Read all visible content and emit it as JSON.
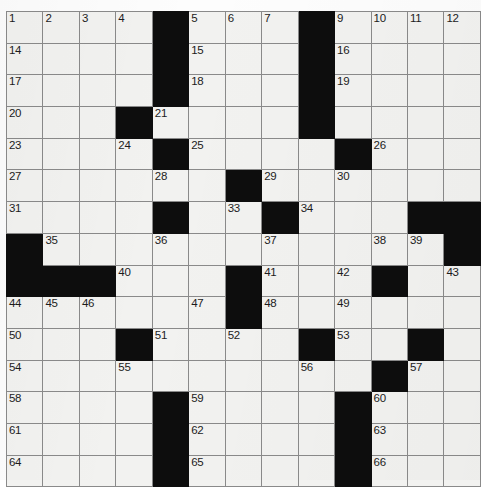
{
  "puzzle": {
    "title": "Crossword Grid",
    "type": "crossword",
    "columns": 13,
    "rows": 15,
    "colors": {
      "block": "#0d0d0d",
      "open_cell": "#f2f2f0",
      "grid_line": "#8a8a8a",
      "border": "#6b6b6b",
      "number_text": "#1c1c1c",
      "page_background": "#ffffff"
    },
    "cell_size_px": 32,
    "highest_clue_number": 66,
    "blocks": [
      [
        1,
        5
      ],
      [
        1,
        9
      ],
      [
        2,
        5
      ],
      [
        2,
        9
      ],
      [
        3,
        5
      ],
      [
        3,
        9
      ],
      [
        4,
        4
      ],
      [
        4,
        9
      ],
      [
        5,
        5
      ],
      [
        5,
        10
      ],
      [
        6,
        7
      ],
      [
        7,
        5
      ],
      [
        7,
        8
      ],
      [
        7,
        12
      ],
      [
        7,
        13
      ],
      [
        8,
        1
      ],
      [
        8,
        13
      ],
      [
        9,
        1
      ],
      [
        9,
        2
      ],
      [
        9,
        3
      ],
      [
        9,
        7
      ],
      [
        9,
        11
      ],
      [
        10,
        7
      ],
      [
        11,
        4
      ],
      [
        11,
        9
      ],
      [
        11,
        12
      ],
      [
        12,
        11
      ],
      [
        13,
        5
      ],
      [
        13,
        10
      ],
      [
        14,
        5
      ],
      [
        14,
        10
      ],
      [
        15,
        5
      ],
      [
        15,
        10
      ]
    ],
    "numbers": [
      {
        "n": 1,
        "row": 1,
        "col": 1
      },
      {
        "n": 2,
        "row": 1,
        "col": 2
      },
      {
        "n": 3,
        "row": 1,
        "col": 3
      },
      {
        "n": 4,
        "row": 1,
        "col": 4
      },
      {
        "n": 5,
        "row": 1,
        "col": 6
      },
      {
        "n": 6,
        "row": 1,
        "col": 7
      },
      {
        "n": 7,
        "row": 1,
        "col": 8
      },
      {
        "n": 8,
        "row": 1,
        "col": 9
      },
      {
        "n": 9,
        "row": 1,
        "col": 10
      },
      {
        "n": 10,
        "row": 1,
        "col": 11
      },
      {
        "n": 11,
        "row": 1,
        "col": 12
      },
      {
        "n": 12,
        "row": 1,
        "col": 13
      },
      {
        "n": 13,
        "row": 1,
        "col": 14
      },
      {
        "n": 14,
        "row": 2,
        "col": 1
      },
      {
        "n": 15,
        "row": 2,
        "col": 6
      },
      {
        "n": 16,
        "row": 2,
        "col": 10
      },
      {
        "n": 17,
        "row": 3,
        "col": 1
      },
      {
        "n": 18,
        "row": 3,
        "col": 6
      },
      {
        "n": 19,
        "row": 3,
        "col": 10
      },
      {
        "n": 20,
        "row": 4,
        "col": 1
      },
      {
        "n": 21,
        "row": 4,
        "col": 5
      },
      {
        "n": 22,
        "row": 4,
        "col": 9
      },
      {
        "n": 23,
        "row": 5,
        "col": 1
      },
      {
        "n": 24,
        "row": 5,
        "col": 4
      },
      {
        "n": 25,
        "row": 5,
        "col": 6
      },
      {
        "n": 26,
        "row": 5,
        "col": 11
      },
      {
        "n": 27,
        "row": 6,
        "col": 1
      },
      {
        "n": 28,
        "row": 6,
        "col": 5
      },
      {
        "n": 29,
        "row": 6,
        "col": 8
      },
      {
        "n": 30,
        "row": 6,
        "col": 10
      },
      {
        "n": 31,
        "row": 7,
        "col": 1
      },
      {
        "n": 32,
        "row": 7,
        "col": 5
      },
      {
        "n": 33,
        "row": 7,
        "col": 7
      },
      {
        "n": 34,
        "row": 7,
        "col": 9
      },
      {
        "n": 35,
        "row": 8,
        "col": 2
      },
      {
        "n": 36,
        "row": 8,
        "col": 5
      },
      {
        "n": 37,
        "row": 8,
        "col": 8
      },
      {
        "n": 38,
        "row": 8,
        "col": 11
      },
      {
        "n": 39,
        "row": 8,
        "col": 12
      },
      {
        "n": 40,
        "row": 9,
        "col": 4
      },
      {
        "n": 41,
        "row": 9,
        "col": 8
      },
      {
        "n": 42,
        "row": 9,
        "col": 10
      },
      {
        "n": 43,
        "row": 9,
        "col": 13
      },
      {
        "n": 44,
        "row": 10,
        "col": 1
      },
      {
        "n": 45,
        "row": 10,
        "col": 2
      },
      {
        "n": 46,
        "row": 10,
        "col": 3
      },
      {
        "n": 47,
        "row": 10,
        "col": 6
      },
      {
        "n": 48,
        "row": 10,
        "col": 8
      },
      {
        "n": 49,
        "row": 10,
        "col": 10
      },
      {
        "n": 50,
        "row": 11,
        "col": 1
      },
      {
        "n": 51,
        "row": 11,
        "col": 5
      },
      {
        "n": 52,
        "row": 11,
        "col": 7
      },
      {
        "n": 53,
        "row": 11,
        "col": 10
      },
      {
        "n": 54,
        "row": 12,
        "col": 1
      },
      {
        "n": 55,
        "row": 12,
        "col": 4
      },
      {
        "n": 56,
        "row": 12,
        "col": 9
      },
      {
        "n": 57,
        "row": 12,
        "col": 12
      },
      {
        "n": 58,
        "row": 13,
        "col": 1
      },
      {
        "n": 59,
        "row": 13,
        "col": 6
      },
      {
        "n": 60,
        "row": 13,
        "col": 11
      },
      {
        "n": 61,
        "row": 14,
        "col": 1
      },
      {
        "n": 62,
        "row": 14,
        "col": 6
      },
      {
        "n": 63,
        "row": 14,
        "col": 11
      },
      {
        "n": 64,
        "row": 15,
        "col": 1
      },
      {
        "n": 65,
        "row": 15,
        "col": 6
      },
      {
        "n": 66,
        "row": 15,
        "col": 11
      }
    ]
  }
}
